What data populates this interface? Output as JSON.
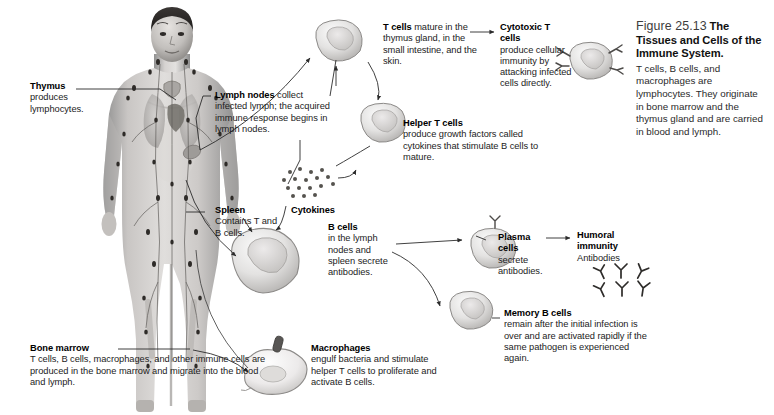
{
  "figure": {
    "number": "Figure 25.13",
    "title": "The Tissues and Cells of the Immune System.",
    "body": "T cells, B cells, and macrophages are lymphocytes. They originate in bone marrow and the thymus gland and are carried in blood and lymph."
  },
  "labels": {
    "thymus": {
      "lead": "Thymus",
      "body": "produces lymphocytes."
    },
    "lymph_nodes": {
      "lead": "Lymph nodes",
      "body": "collect infected lymph; the acquired immune response begins in lymph nodes."
    },
    "spleen": {
      "lead": "Spleen",
      "body": "Contains T and B cells."
    },
    "bone_marrow": {
      "lead": "Bone marrow",
      "body": "T cells, B cells, macrophages, and other immune cells are produced in the bone marrow and migrate into the blood and lymph."
    },
    "t_cells": {
      "lead": "T cells",
      "body": "mature in the thymus gland, in the small intestine, and the skin."
    },
    "cytotoxic_t_cells": {
      "lead": "Cytotoxic T cells",
      "body": "produce cellular immunity by attacking infected cells directly."
    },
    "helper_t_cells": {
      "lead": "Helper T cells",
      "body": "produce growth factors called cytokines that stimulate B cells to mature."
    },
    "cytokines": {
      "lead": "Cytokines"
    },
    "b_cells": {
      "lead": "B cells",
      "body": "in the lymph nodes and spleen secrete antibodies."
    },
    "plasma_cells": {
      "lead": "Plasma cells",
      "body": "secrete antibodies."
    },
    "humoral_immunity": {
      "lead": "Humoral immunity",
      "body": "Antibodies"
    },
    "memory_b_cells": {
      "lead": "Memory B cells",
      "body": "remain after the initial infection is over and are activated rapidly if the same pathogen is experienced again."
    },
    "macrophages": {
      "lead": "Macrophages",
      "body": "engulf bacteria and stimulate helper T cells to proliferate and activate B cells."
    }
  },
  "colors": {
    "text": "#1c1c1c",
    "lead": "#000000",
    "leader_line": "#2b2b2b",
    "cell_fill": "#e9e9e9",
    "cell_stroke": "#6d6d6d",
    "background": "#ffffff"
  }
}
